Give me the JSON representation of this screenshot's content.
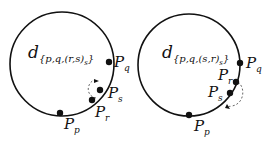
{
  "diagrams": [
    {
      "label_main": "d",
      "label_sub": "{p,q,(r,s)s}",
      "label_sub_display": "{p,q,(r,s)",
      "label_sub_inner": "s",
      "label_sub_close": "}",
      "points": [
        {
          "name": "P",
          "sub": "q"
        },
        {
          "name": "P",
          "sub": "s"
        },
        {
          "name": "P",
          "sub": "r"
        },
        {
          "name": "P",
          "sub": "p"
        }
      ]
    },
    {
      "label_main": "d",
      "label_sub": "{p,q,(s,r)s}",
      "label_sub_display": "{p,q,(s,r)",
      "label_sub_inner": "s",
      "label_sub_close": "}",
      "points": [
        {
          "name": "P",
          "sub": "q"
        },
        {
          "name": "P",
          "sub": "r"
        },
        {
          "name": "P",
          "sub": "s"
        },
        {
          "name": "P",
          "sub": "p"
        }
      ]
    }
  ],
  "colors": {
    "stroke": "#111111",
    "dashed": "#555555"
  }
}
